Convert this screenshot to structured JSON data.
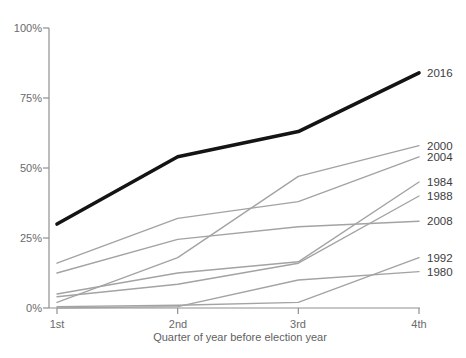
{
  "chart_data": {
    "type": "line",
    "title": "",
    "xlabel": "Quarter of year before election year",
    "ylabel": "",
    "categories": [
      "1st",
      "2nd",
      "3rd",
      "4th"
    ],
    "y_ticks": [
      "100%",
      "75%",
      "50%",
      "25%",
      "0%"
    ],
    "ylim": [
      0,
      100
    ],
    "grid": false,
    "legend_position": "labels-at-line-ends",
    "series": [
      {
        "name": "2016",
        "values": [
          30,
          54,
          63,
          84
        ],
        "emphasis": true
      },
      {
        "name": "2000",
        "values": [
          2,
          18,
          47,
          58
        ],
        "emphasis": false
      },
      {
        "name": "2004",
        "values": [
          16,
          32,
          38,
          54
        ],
        "emphasis": false
      },
      {
        "name": "1984",
        "values": [
          5,
          12.5,
          16.5,
          45
        ],
        "emphasis": false
      },
      {
        "name": "1988",
        "values": [
          4,
          8.5,
          16,
          40
        ],
        "emphasis": false
      },
      {
        "name": "2008",
        "values": [
          12.5,
          24.5,
          29,
          31
        ],
        "emphasis": false
      },
      {
        "name": "1992",
        "values": [
          0.5,
          1,
          2,
          18
        ],
        "emphasis": false
      },
      {
        "name": "1980",
        "values": [
          0,
          0.5,
          10,
          13
        ],
        "emphasis": false
      }
    ]
  },
  "colors": {
    "background": "#ffffff",
    "axis": "#8f8f8f",
    "line_gray": "#a3a3a3",
    "line_emphasis": "#141414",
    "tick_text": "#6a6a6a",
    "series_label_text": "#3d3d3d"
  }
}
